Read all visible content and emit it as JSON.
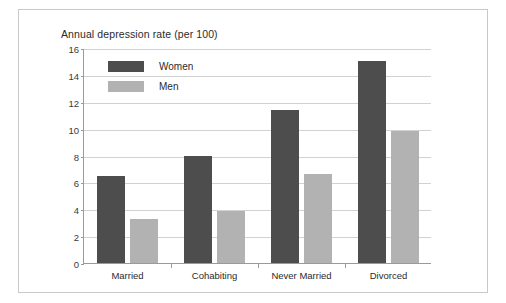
{
  "chart_data": {
    "type": "bar",
    "title": "Annual depression rate (per 100)",
    "xlabel": "",
    "ylabel": "",
    "ylim": [
      0,
      16
    ],
    "yticks": [
      0,
      2,
      4,
      6,
      8,
      10,
      12,
      14,
      16
    ],
    "grid": true,
    "legend_position": "top-left inside plot",
    "categories": [
      "Married",
      "Cohabiting",
      "Never Married",
      "Divorced"
    ],
    "series": [
      {
        "name": "Women",
        "color": "#4d4d4d",
        "values": [
          6.5,
          8.0,
          11.4,
          15.0
        ]
      },
      {
        "name": "Men",
        "color": "#b2b2b2",
        "values": [
          3.3,
          3.9,
          6.6,
          9.8
        ]
      }
    ]
  },
  "figure": {
    "background": "#ffffff",
    "border_color": "#c9c9c9",
    "gridline_color": "#d2d2d2",
    "axis_color": "#9a9a9a"
  }
}
